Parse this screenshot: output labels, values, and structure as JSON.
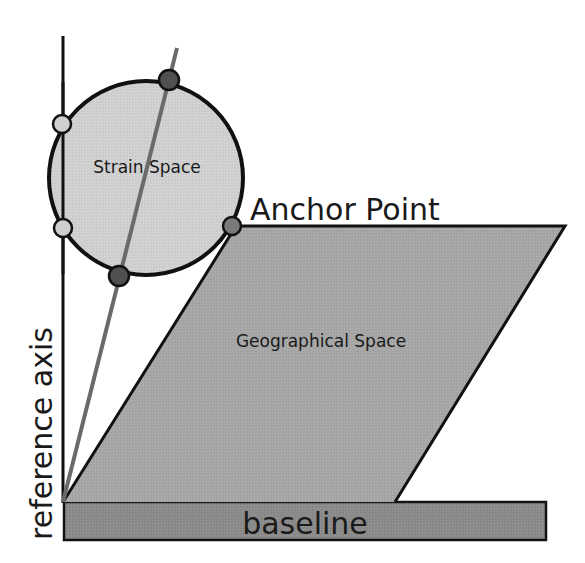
{
  "labels": {
    "strain_space": "Strain Space",
    "anchor_point": "Anchor Point",
    "geographical_space": "Geographical Space",
    "reference_axis": "reference axis",
    "baseline": "baseline"
  },
  "colors": {
    "outline": "#111111",
    "strain_fill": "#d2d2d2",
    "geo_fill": "#a8a8a8",
    "baseline_fill": "#8c8c8c",
    "projection_line": "#6a6a6a",
    "light_point": "#cfcfcf",
    "dark_point": "#505050",
    "anchor_point": "#7a7a7a"
  },
  "geometry": {
    "reference_axis": {
      "x": 63,
      "y1": 36,
      "y2": 502
    },
    "strain_circle": {
      "cx": 146,
      "cy": 178,
      "r": 97
    },
    "projection_line": {
      "x1": 63,
      "y1": 502,
      "x2": 177,
      "y2": 48
    },
    "parallelogram": [
      [
        63,
        502
      ],
      [
        236,
        226
      ],
      [
        565,
        226
      ],
      [
        395,
        502
      ]
    ],
    "baseline_rect": {
      "x": 64,
      "y": 502,
      "width": 482,
      "height": 38
    },
    "points": [
      {
        "name": "upper-axis-intersection",
        "x": 62,
        "y": 124,
        "type": "light"
      },
      {
        "name": "lower-axis-intersection",
        "x": 63,
        "y": 228,
        "type": "light"
      },
      {
        "name": "upper-projection-intersection",
        "x": 169,
        "y": 80,
        "type": "dark"
      },
      {
        "name": "lower-projection-intersection",
        "x": 119,
        "y": 276,
        "type": "dark"
      },
      {
        "name": "anchor-point",
        "x": 232,
        "y": 226,
        "type": "anchor"
      }
    ]
  }
}
